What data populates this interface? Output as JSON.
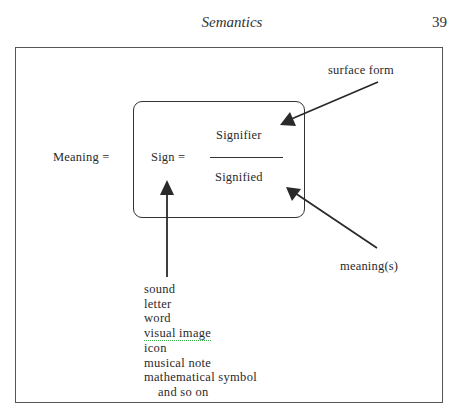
{
  "header": {
    "running_head": "Semantics",
    "page_number": "39"
  },
  "figure": {
    "meaning_label": "Meaning =",
    "sign_label": "Sign =",
    "signifier_label": "Signifier",
    "signified_label": "Signified",
    "surface_form_label": "surface form",
    "meanings_label": "meaning(s)",
    "sign_examples": [
      "sound",
      "letter",
      "word",
      "visual image",
      "icon",
      "musical note",
      "mathematical symbol",
      "and so on"
    ],
    "colors": {
      "ink": "#2a2a2a",
      "frame": "#555555",
      "spellcheck_underline": "#3bb84a"
    }
  }
}
